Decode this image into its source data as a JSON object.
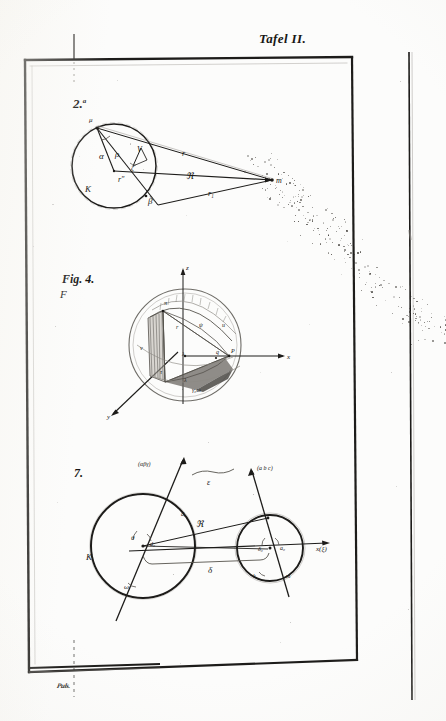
{
  "plate": {
    "title": "Tafel II.",
    "background_color": "#fcfcfb",
    "ink_color": "#1d1c1a",
    "signature_mark": "Puls.",
    "paper_edge_present": true
  },
  "figures": [
    {
      "id": "fig2",
      "number_label": "2.",
      "superscript": "a",
      "description": "Circle K with tangent/secant construction to external point m",
      "labels": {
        "circle_name": "K",
        "apex_point": "μ",
        "center_point": "r''",
        "external_point": "m",
        "angle_alpha": "α",
        "angle_beta": "β",
        "segment_rho": "ρ",
        "segment_zeta": "ζ",
        "segment_V": "V",
        "ray_r": "r",
        "ray_r1": "r₁",
        "radius_R": "ℜ"
      }
    },
    {
      "id": "fig4",
      "number_label": "Fig. 4.",
      "sub_label": "F",
      "description": "Sphere with rectangular coordinate axes and shaded spherical triangle sector",
      "labels": {
        "axis_z": "z",
        "axis_x": "x",
        "axis_y": "y",
        "vertex_top": "π",
        "face_left": "τ",
        "face_mid": "ψ",
        "face_right": "ω",
        "inner_u": "u",
        "inner_v": "v",
        "inner_t": "τ",
        "inner_l": "λ",
        "point_p": "P",
        "point_q": "q",
        "arc_label": "γ₀ω"
      }
    },
    {
      "id": "fig7",
      "number_label": "7.",
      "description": "Two circles K and k joined by distance R, with direction axes and angles",
      "labels": {
        "big_circle": "K",
        "axis_alpha_beta_gamma": "(αβγ)",
        "axis_a_b_c": "(a b c)",
        "axis_x_xi": "x(ξ)",
        "distance_R": "ℜ",
        "brace_delta": "δ",
        "brace_epsilon": "ε",
        "angle_theta": "θ",
        "angle_omega": "ω",
        "angle_a0": "a₀",
        "angle_d0": "d₀",
        "angle_delta0": "δ₀",
        "point_k": "k"
      }
    }
  ]
}
